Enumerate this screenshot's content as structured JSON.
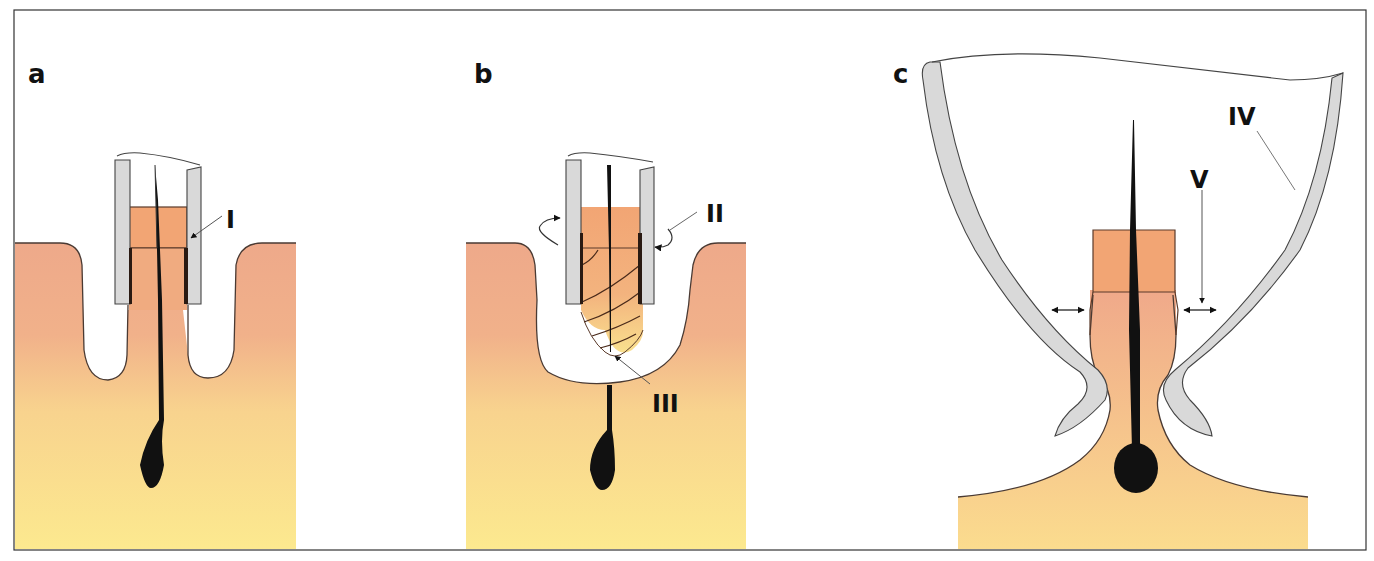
{
  "figure": {
    "panels": [
      {
        "id": "a",
        "label": "a",
        "annotations": [
          {
            "label": "I"
          }
        ]
      },
      {
        "id": "b",
        "label": "b",
        "annotations": [
          {
            "label": "II"
          },
          {
            "label": "III"
          }
        ]
      },
      {
        "id": "c",
        "label": "c",
        "annotations": [
          {
            "label": "IV"
          },
          {
            "label": "V"
          }
        ]
      }
    ]
  },
  "colors": {
    "skin_top": "#eea98a",
    "skin_bottom": "#fbe58f",
    "graft_tissue": "#f2a574",
    "graft_light": "#f7c98a",
    "punch_wall": "#d8d8d8",
    "outline": "#4a3a33",
    "hair": "#111111",
    "frame": "#333333"
  }
}
